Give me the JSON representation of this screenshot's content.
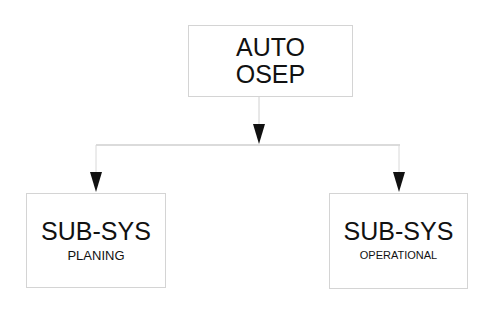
{
  "diagram": {
    "type": "hierarchy",
    "root": {
      "line1": "AUTO",
      "line2": "OSEP"
    },
    "children": [
      {
        "title": "SUB-SYS",
        "subtitle": "PLANING"
      },
      {
        "title": "SUB-SYS",
        "subtitle": "OPERATIONAL"
      }
    ],
    "colors": {
      "box_border": "#d4d4d4",
      "connector": "#cfcfcf",
      "arrow": "#111111",
      "text": "#111111"
    }
  }
}
